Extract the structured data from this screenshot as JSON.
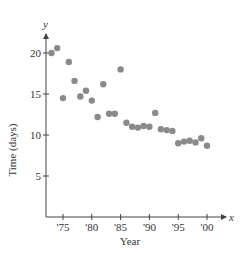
{
  "chart_data": {
    "type": "scatter",
    "title": "",
    "xlabel": "Year",
    "ylabel": "Time (days)",
    "x_axis_var": "x",
    "y_axis_var": "y",
    "xlim": [
      1972,
      2003
    ],
    "ylim": [
      0,
      22
    ],
    "x_ticks": [
      1975,
      1980,
      1985,
      1990,
      1995,
      2000
    ],
    "x_tick_labels": [
      "'75",
      "'80",
      "'85",
      "'90",
      "'95",
      "'00"
    ],
    "y_ticks": [
      5,
      10,
      15,
      20
    ],
    "y_tick_labels": [
      "5",
      "10",
      "15",
      "20"
    ],
    "grid": false,
    "legend": null,
    "marker_color": "#8a8a8a",
    "axis_color": "#444444",
    "series": [
      {
        "name": "Time (days)",
        "x": [
          1973,
          1974,
          1975,
          1976,
          1977,
          1978,
          1979,
          1980,
          1981,
          1982,
          1983,
          1984,
          1985,
          1986,
          1987,
          1988,
          1989,
          1990,
          1991,
          1992,
          1993,
          1994,
          1995,
          1996,
          1997,
          1998,
          1999,
          2000
        ],
        "values": [
          20.0,
          20.6,
          14.5,
          18.9,
          16.6,
          14.7,
          15.4,
          14.2,
          12.2,
          16.2,
          12.6,
          12.6,
          18.0,
          11.5,
          11.0,
          10.9,
          11.1,
          11.0,
          12.7,
          10.7,
          10.6,
          10.5,
          9.0,
          9.2,
          9.3,
          9.1,
          9.6,
          8.7
        ]
      }
    ]
  }
}
